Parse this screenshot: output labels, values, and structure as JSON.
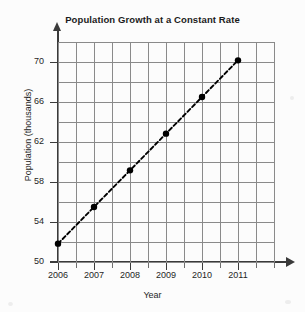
{
  "chart_data": {
    "type": "line",
    "title": "Population Growth at a Constant Rate",
    "xlabel": "Year",
    "ylabel": "Population (thousands)",
    "categories": [
      "2006",
      "2007",
      "2008",
      "2009",
      "2010",
      "2011"
    ],
    "x": [
      2006,
      2007,
      2008,
      2009,
      2010,
      2011
    ],
    "values": [
      50,
      54,
      58,
      62,
      66,
      70
    ],
    "series": [
      {
        "name": "Population",
        "values": [
          50,
          54,
          58,
          62,
          66,
          70
        ],
        "line_style": "dashed",
        "line_color": "#000000",
        "marker": "filled-circle",
        "marker_color": "#000000"
      }
    ],
    "xlim": [
      2006,
      2012
    ],
    "ylim": [
      48,
      72
    ],
    "y_major_ticks": [
      50,
      54,
      58,
      62,
      66,
      70
    ],
    "y_minor_step": 2,
    "x_major_ticks": [
      2006,
      2007,
      2008,
      2009,
      2010,
      2011
    ],
    "x_minor_step": 0.5,
    "grid": true,
    "grid_color": "#8a8a8a",
    "axis_color": "#3a3a3a",
    "legend": "none",
    "background": "#fcfcfc",
    "y_axis_arrow": true,
    "x_axis_arrow": true,
    "annotations": []
  },
  "axis": {
    "y_tick_labels": [
      "70",
      "66",
      "62",
      "58",
      "54",
      "50"
    ],
    "x_tick_labels": [
      "2006",
      "2007",
      "2008",
      "2009",
      "2010",
      "2011"
    ]
  }
}
